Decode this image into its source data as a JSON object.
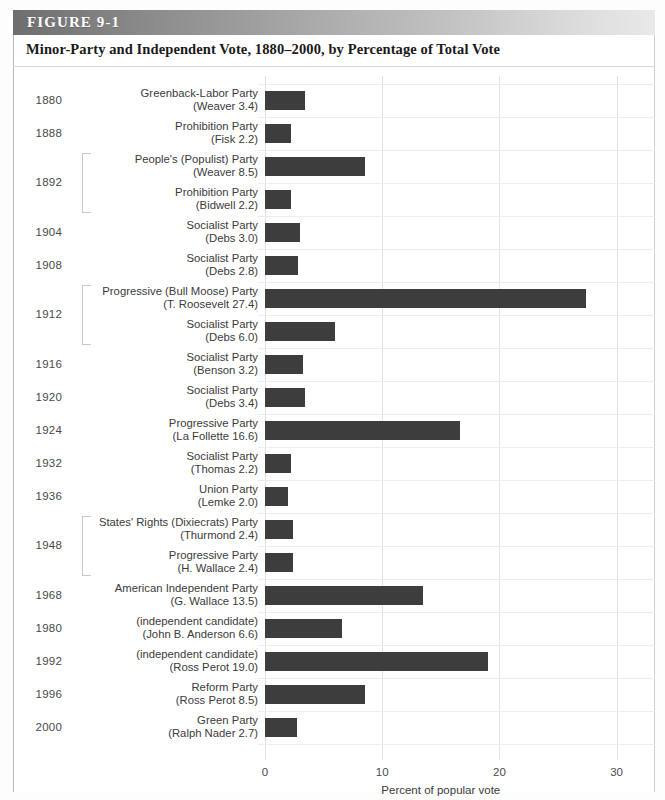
{
  "figure": {
    "label": "FIGURE 9-1",
    "title": "Minor-Party and Independent Vote, 1880–2000, by Percentage of Total Vote"
  },
  "chart_data": {
    "type": "bar",
    "orientation": "horizontal",
    "title": "Minor-Party and Independent Vote, 1880–2000, by Percentage of Total Vote",
    "xlabel": "Percent of popular vote",
    "ylabel": "",
    "xlim": [
      0,
      30
    ],
    "xticks": [
      0,
      10,
      20,
      30
    ],
    "xtick_labels": [
      "0",
      "10",
      "20",
      "30"
    ],
    "grid": "vertical",
    "legend": "none",
    "bar_color": "#3d3d3d",
    "categories": [
      "Greenback-Labor Party (Weaver 3.4)",
      "Prohibition Party (Fisk 2.2)",
      "People's (Populist) Party (Weaver 8.5)",
      "Prohibition Party (Bidwell 2.2)",
      "Socialist Party (Debs 3.0)",
      "Socialist Party (Debs 2.8)",
      "Progressive (Bull Moose) Party (T. Roosevelt 27.4)",
      "Socialist Party (Debs 6.0)",
      "Socialist Party (Benson 3.2)",
      "Socialist Party (Debs 3.4)",
      "Progressive Party (La Follette 16.6)",
      "Socialist Party (Thomas 2.2)",
      "Union Party (Lemke 2.0)",
      "States' Rights (Dixiecrats) Party (Thurmond 2.4)",
      "Progressive Party (H. Wallace 2.4)",
      "American Independent Party (G. Wallace 13.5)",
      "(independent candidate) (John B. Anderson 6.6)",
      "(independent candidate) (Ross Perot 19.0)",
      "Reform Party (Ross Perot 8.5)",
      "Green Party (Ralph Nader 2.7)"
    ],
    "values": [
      3.4,
      2.2,
      8.5,
      2.2,
      3.0,
      2.8,
      27.4,
      6.0,
      3.2,
      3.4,
      16.6,
      2.2,
      2.0,
      2.4,
      2.4,
      13.5,
      6.6,
      19.0,
      8.5,
      2.7
    ],
    "rows": [
      {
        "year": "1880",
        "party": "Greenback-Labor Party",
        "candidate": "(Weaver 3.4)",
        "value": 3.4,
        "group_start": true,
        "group_size": 1
      },
      {
        "year": "1888",
        "party": "Prohibition Party",
        "candidate": "(Fisk 2.2)",
        "value": 2.2,
        "group_start": true,
        "group_size": 1
      },
      {
        "year": "1892",
        "party": "People's (Populist) Party",
        "candidate": "(Weaver 8.5)",
        "value": 8.5,
        "group_start": true,
        "group_size": 2
      },
      {
        "year": "",
        "party": "Prohibition Party",
        "candidate": "(Bidwell 2.2)",
        "value": 2.2,
        "group_start": false,
        "group_size": 0
      },
      {
        "year": "1904",
        "party": "Socialist Party",
        "candidate": "(Debs 3.0)",
        "value": 3.0,
        "group_start": true,
        "group_size": 1
      },
      {
        "year": "1908",
        "party": "Socialist Party",
        "candidate": "(Debs 2.8)",
        "value": 2.8,
        "group_start": true,
        "group_size": 1
      },
      {
        "year": "1912",
        "party": "Progressive (Bull Moose) Party",
        "candidate": "(T. Roosevelt 27.4)",
        "value": 27.4,
        "group_start": true,
        "group_size": 2
      },
      {
        "year": "",
        "party": "Socialist Party",
        "candidate": "(Debs 6.0)",
        "value": 6.0,
        "group_start": false,
        "group_size": 0
      },
      {
        "year": "1916",
        "party": "Socialist Party",
        "candidate": "(Benson 3.2)",
        "value": 3.2,
        "group_start": true,
        "group_size": 1
      },
      {
        "year": "1920",
        "party": "Socialist Party",
        "candidate": "(Debs 3.4)",
        "value": 3.4,
        "group_start": true,
        "group_size": 1
      },
      {
        "year": "1924",
        "party": "Progressive Party",
        "candidate": "(La Follette 16.6)",
        "value": 16.6,
        "group_start": true,
        "group_size": 1
      },
      {
        "year": "1932",
        "party": "Socialist Party",
        "candidate": "(Thomas 2.2)",
        "value": 2.2,
        "group_start": true,
        "group_size": 1
      },
      {
        "year": "1936",
        "party": "Union Party",
        "candidate": "(Lemke 2.0)",
        "value": 2.0,
        "group_start": true,
        "group_size": 1
      },
      {
        "year": "1948",
        "party": "States' Rights (Dixiecrats) Party",
        "candidate": "(Thurmond 2.4)",
        "value": 2.4,
        "group_start": true,
        "group_size": 2
      },
      {
        "year": "",
        "party": "Progressive Party",
        "candidate": "(H. Wallace 2.4)",
        "value": 2.4,
        "group_start": false,
        "group_size": 0
      },
      {
        "year": "1968",
        "party": "American Independent Party",
        "candidate": "(G. Wallace 13.5)",
        "value": 13.5,
        "group_start": true,
        "group_size": 1
      },
      {
        "year": "1980",
        "party": "(independent candidate)",
        "candidate": "(John B. Anderson 6.6)",
        "value": 6.6,
        "group_start": true,
        "group_size": 1
      },
      {
        "year": "1992",
        "party": "(independent candidate)",
        "candidate": "(Ross Perot 19.0)",
        "value": 19.0,
        "group_start": true,
        "group_size": 1
      },
      {
        "year": "1996",
        "party": "Reform Party",
        "candidate": "(Ross Perot 8.5)",
        "value": 8.5,
        "group_start": true,
        "group_size": 1
      },
      {
        "year": "2000",
        "party": "Green Party",
        "candidate": "(Ralph Nader 2.7)",
        "value": 2.7,
        "group_start": true,
        "group_size": 1
      }
    ]
  }
}
